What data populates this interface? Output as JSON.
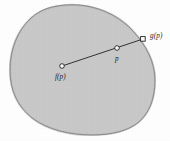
{
  "figure": {
    "background_color": "#ffffff",
    "region": {
      "name": "shaded-region",
      "fill_color": "#c9c9c9",
      "stroke_color": "#4a4a4a",
      "stroke_width": 0.9,
      "description": "irregular closed convex blob"
    },
    "segment": {
      "stroke_color": "#232323",
      "stroke_width": 0.9
    },
    "points": [
      {
        "id": "fp",
        "label": "f(p)",
        "marker": "circle",
        "marker_fill": "#ffffff",
        "marker_stroke": "#232323",
        "x": 62,
        "y": 66,
        "label_x": 55,
        "label_y": 74
      },
      {
        "id": "p",
        "label": "p",
        "marker": "circle",
        "marker_fill": "#ffffff",
        "marker_stroke": "#232323",
        "x": 117,
        "y": 48,
        "label_x": 115,
        "label_y": 56
      },
      {
        "id": "gp",
        "label": "g(p)",
        "marker": "square",
        "marker_fill": "#ffffff",
        "marker_stroke": "#232323",
        "x": 143,
        "y": 39,
        "label_x": 150,
        "label_y": 33
      }
    ]
  }
}
